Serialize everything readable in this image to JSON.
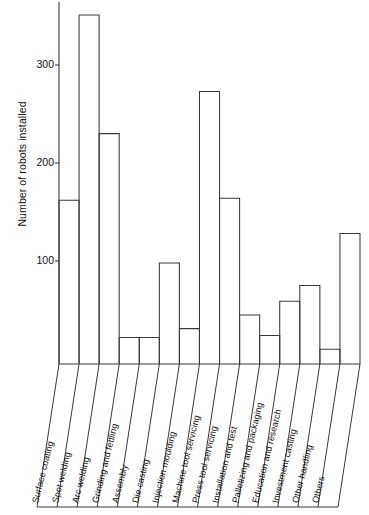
{
  "chart_data": {
    "type": "bar",
    "title": "",
    "subtitle": "",
    "xlabel": "",
    "ylabel": "Number of robots installed",
    "ylim": [
      0,
      370
    ],
    "yticks": [
      100,
      200,
      300
    ],
    "ytick_labels": [
      "100",
      "200",
      "300"
    ],
    "grid": false,
    "legend": null,
    "orientation": "vertical",
    "bar_style": "outline",
    "categories": [
      "Surface coating",
      "Spot welding",
      "Arc welding",
      "Grinding and fettling",
      "Assembly",
      "Die casting",
      "Injection moulding",
      "Machine tool servicing",
      "Press tool servicing",
      "Installation and test",
      "Palletizing and packaging",
      "Education and research",
      "Investment casting",
      "Other handling",
      "Others"
    ],
    "values": [
      162,
      351,
      230,
      22,
      22,
      98,
      31,
      273,
      164,
      45,
      24,
      59,
      75,
      10,
      128
    ],
    "colors": {
      "bar_stroke": "#3a3a3a",
      "bar_fill": "#ffffff",
      "axis": "#3a3a3a",
      "text": "#111111",
      "background": "#ffffff"
    }
  },
  "axis": {
    "y_title": "Number of robots installed",
    "ticks": [
      {
        "label": "300",
        "value": 300
      },
      {
        "label": "200",
        "value": 200
      },
      {
        "label": "100",
        "value": 100
      }
    ]
  }
}
